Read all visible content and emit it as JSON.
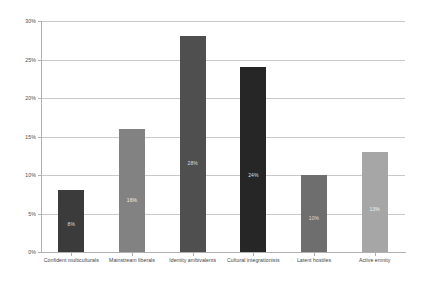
{
  "chart_data": {
    "type": "bar",
    "title": "",
    "subtitle": "",
    "xlabel": "",
    "ylabel": "",
    "ylim": [
      0,
      30
    ],
    "yticks": [
      "0%",
      "5%",
      "10%",
      "15%",
      "20%",
      "25%",
      "30%"
    ],
    "ytick_values": [
      0,
      5,
      10,
      15,
      20,
      25,
      30
    ],
    "grid": true,
    "legend": false,
    "legend_position": "none",
    "categories": [
      "Confident multiculturals",
      "Mainstream liberals",
      "Identity ambivalents",
      "Cultural integrationists",
      "Latent hostiles",
      "Active enmity"
    ],
    "values": [
      8,
      16,
      28,
      24,
      10,
      13
    ],
    "data_labels": [
      "8%",
      "16%",
      "28%",
      "24%",
      "10%",
      "13%"
    ],
    "bar_colors": [
      "#3b3b3b",
      "#828282",
      "#4f4f4f",
      "#262626",
      "#6e6e6e",
      "#a6a6a6"
    ],
    "axis_color": "#b0b0b0",
    "gridline_color": "#c9c9c9",
    "background_color": "#ffffff"
  }
}
